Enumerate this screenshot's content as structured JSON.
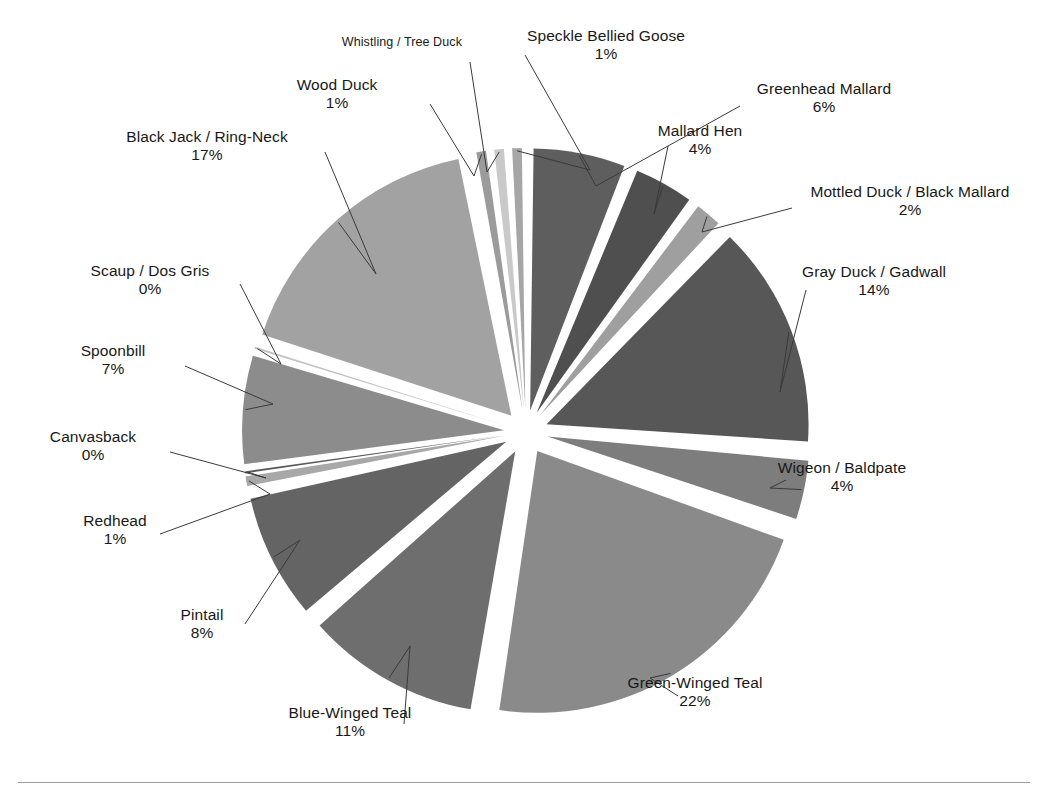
{
  "chart_data": {
    "type": "pie",
    "title": "",
    "exploded": true,
    "legend_position": "none",
    "labels_outside": true,
    "categories": [
      "Greenhead Mallard",
      "Mallard Hen",
      "Mottled Duck / Black Mallard",
      "Gray Duck / Gadwall",
      "Wigeon / Baldpate",
      "Green-Winged Teal",
      "Blue-Winged Teal",
      "Pintail",
      "Redhead",
      "Canvasback",
      "Spoonbill",
      "Scaup / Dos Gris",
      "Black Jack / Ring-Neck",
      "Wood Duck",
      "Whistling / Tree Duck",
      "Speckle Bellied Goose"
    ],
    "values": [
      6,
      4,
      2,
      14,
      4,
      22,
      11,
      8,
      1,
      0,
      7,
      0,
      17,
      1,
      1,
      1
    ],
    "percent_labels": [
      "6%",
      "4%",
      "2%",
      "14%",
      "4%",
      "22%",
      "11%",
      "8%",
      "1%",
      "0%",
      "7%",
      "0%",
      "17%",
      "1%",
      "",
      "1%"
    ],
    "slice_colors": [
      "#5e5e5e",
      "#4f4f4f",
      "#9f9f9f",
      "#575757",
      "#7d7d7d",
      "#8a8a8a",
      "#6e6e6e",
      "#646464",
      "#a8a8a8",
      "#5a5a5a",
      "#8c8c8c",
      "#c2c2c2",
      "#a2a2a2",
      "#9b9b9b",
      "#c9c9c9",
      "#a6a6a6"
    ],
    "xlabel": "",
    "ylabel": ""
  },
  "slices": [
    {
      "name": "Greenhead Mallard",
      "percent": "6%",
      "value": 6
    },
    {
      "name": "Mallard Hen",
      "percent": "4%",
      "value": 4
    },
    {
      "name": "Mottled Duck / Black Mallard",
      "percent": "2%",
      "value": 2
    },
    {
      "name": "Gray Duck / Gadwall",
      "percent": "14%",
      "value": 14
    },
    {
      "name": "Wigeon / Baldpate",
      "percent": "4%",
      "value": 4
    },
    {
      "name": "Green-Winged Teal",
      "percent": "22%",
      "value": 22
    },
    {
      "name": "Blue-Winged Teal",
      "percent": "11%",
      "value": 11
    },
    {
      "name": "Pintail",
      "percent": "8%",
      "value": 8
    },
    {
      "name": "Redhead",
      "percent": "1%",
      "value": 1
    },
    {
      "name": "Canvasback",
      "percent": "0%",
      "value": 0
    },
    {
      "name": "Spoonbill",
      "percent": "7%",
      "value": 7
    },
    {
      "name": "Scaup / Dos Gris",
      "percent": "0%",
      "value": 0
    },
    {
      "name": "Black Jack / Ring-Neck",
      "percent": "17%",
      "value": 17
    },
    {
      "name": "Wood Duck",
      "percent": "1%",
      "value": 1
    },
    {
      "name": "Whistling / Tree Duck",
      "percent": "",
      "value": 1
    },
    {
      "name": "Speckle Bellied Goose",
      "percent": "1%",
      "value": 1
    }
  ],
  "footer": {
    "caption": ""
  }
}
